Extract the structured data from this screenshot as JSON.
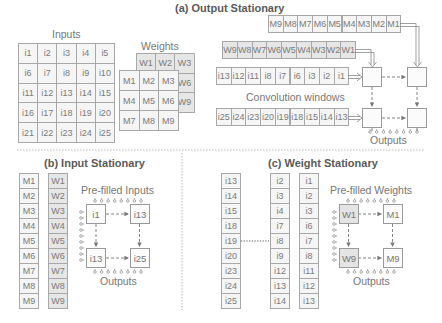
{
  "panel_a": {
    "title": "(a) Output Stationary",
    "inputs_label": "Inputs",
    "inputs_grid": [
      [
        "i1",
        "i2",
        "i3",
        "i4",
        "i5"
      ],
      [
        "i6",
        "i7",
        "i8",
        "i9",
        "i10"
      ],
      [
        "i11",
        "i12",
        "i13",
        "i14",
        "i15"
      ],
      [
        "i16",
        "i17",
        "i18",
        "i19",
        "i20"
      ],
      [
        "i21",
        "i22",
        "i23",
        "i24",
        "i25"
      ]
    ],
    "weights_label": "Weights",
    "weights_grid": [
      [
        "W1",
        "W2",
        "W3"
      ],
      [
        "W4",
        "W5",
        "W6"
      ],
      [
        "W7",
        "W8",
        "W9"
      ]
    ],
    "m_grid": [
      [
        "M1",
        "M2",
        "M3"
      ],
      [
        "M4",
        "M5",
        "M6"
      ],
      [
        "M7",
        "M8",
        "M9"
      ]
    ],
    "m_stream": [
      "M9",
      "M8",
      "M7",
      "M6",
      "M5",
      "M4",
      "M3",
      "M2",
      "M1"
    ],
    "w_stream": [
      "W9",
      "W8",
      "W7",
      "W6",
      "W5",
      "W4",
      "W3",
      "W2",
      "W1"
    ],
    "window_1": [
      "i13",
      "i12",
      "i11",
      "i8",
      "i7",
      "i6",
      "i3",
      "i2",
      "i1"
    ],
    "window_2": [
      "i25",
      "i24",
      "i23",
      "i20",
      "i19",
      "i18",
      "i15",
      "i14",
      "i13"
    ],
    "windows_label": "Convolution windows",
    "outputs_label": "Outputs"
  },
  "panel_b": {
    "title": "(b) Input Stationary",
    "m_column": [
      "M1",
      "M2",
      "M3",
      "M4",
      "M5",
      "M6",
      "M7",
      "M8",
      "M9"
    ],
    "w_column": [
      "W1",
      "W2",
      "W3",
      "W4",
      "W5",
      "W6",
      "W7",
      "W8",
      "W9"
    ],
    "prefilled_label": "Pre-filled Inputs",
    "pe": [
      "i1",
      "i13",
      "i13",
      "i25"
    ],
    "outputs_label": "Outputs"
  },
  "panel_c": {
    "title": "(c) Weight Stationary",
    "col_1": [
      "i13",
      "i14",
      "i15",
      "i18",
      "i19",
      "i20",
      "i23",
      "i24",
      "i25"
    ],
    "col_2": [
      "i2",
      "i3",
      "i4",
      "i7",
      "i8",
      "i9",
      "i12",
      "i13",
      "i14"
    ],
    "col_3": [
      "i1",
      "i2",
      "i3",
      "i6",
      "i7",
      "i8",
      "i11",
      "i12",
      "i13"
    ],
    "prefilled_label": "Pre-filled Weights",
    "pe": [
      "W1",
      "M1",
      "W9",
      "M9"
    ],
    "outputs_label": "Outputs"
  }
}
